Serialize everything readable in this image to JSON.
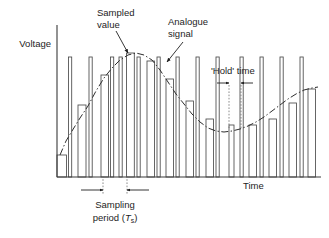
{
  "figure": {
    "title_visible": false,
    "background_color": "#ffffff",
    "line_color": "#333333"
  },
  "axes": {
    "y_label": "Voltage",
    "x_label": "Time",
    "origin": {
      "x": 57,
      "y": 177
    },
    "y_top": 25,
    "x_right": 321
  },
  "annotations": {
    "sampled_value": {
      "line1": "Sampled",
      "line2": "value",
      "text_x": 97,
      "text_y1": 16,
      "text_y2": 28,
      "arrow_from": {
        "x": 116,
        "y": 31
      },
      "arrow_to": {
        "x": 128,
        "y": 53
      }
    },
    "analogue_signal": {
      "line1": "Analogue",
      "line2": "signal",
      "text_x": 168,
      "text_y1": 25,
      "text_y2": 37,
      "arrow_from": {
        "x": 183,
        "y": 42
      },
      "arrow_to": {
        "x": 167,
        "y": 62
      }
    },
    "hold_time": {
      "label": "'Hold' time",
      "text_x": 211,
      "text_y": 74,
      "left_guide_x": 229,
      "right_guide_x": 241,
      "guide_top_y": 85,
      "guide_bottom_y": 128,
      "dim_y": 83
    },
    "sampling_period": {
      "line1": "Sampling",
      "line2": "period (",
      "symbol": "T",
      "subscript": "s",
      "closing": ")",
      "text_x": 77,
      "text_y1": 208,
      "text_y2": 221,
      "left_guide_x": 103,
      "right_guide_x": 127,
      "guide_top_y": 176,
      "guide_bottom_y": 194,
      "dim_y": 190
    }
  },
  "chart_data": {
    "type": "bar",
    "xlabel": "Time",
    "ylabel": "Voltage",
    "grid": false,
    "legend_position": "none",
    "axis_ranges": {
      "x": [
        0,
        26
      ],
      "y": [
        0,
        1
      ]
    },
    "categories": [
      0,
      1,
      2,
      3,
      4,
      5,
      6,
      7,
      8,
      9,
      10,
      11,
      12,
      13,
      14,
      15,
      16,
      17,
      18,
      19,
      20,
      21
    ],
    "bars": [
      {
        "x": 57.0,
        "w": 9.5,
        "h": 22.0
      },
      {
        "x": 68.5,
        "w": 3.2,
        "h": 120.0
      },
      {
        "x": 78.0,
        "w": 8.0,
        "h": 72.0
      },
      {
        "x": 89.0,
        "w": 3.2,
        "h": 120.0
      },
      {
        "x": 101.0,
        "w": 7.5,
        "h": 102.0
      },
      {
        "x": 110.5,
        "w": 3.2,
        "h": 120.0
      },
      {
        "x": 119.0,
        "w": 3.2,
        "h": 120.0
      },
      {
        "x": 126.5,
        "w": 7.8,
        "h": 124.0
      },
      {
        "x": 137.0,
        "w": 3.2,
        "h": 120.0
      },
      {
        "x": 147.0,
        "w": 7.5,
        "h": 116.0
      },
      {
        "x": 157.0,
        "w": 3.2,
        "h": 120.0
      },
      {
        "x": 166.0,
        "w": 7.5,
        "h": 98.0
      },
      {
        "x": 176.0,
        "w": 3.2,
        "h": 120.0
      },
      {
        "x": 186.0,
        "w": 7.5,
        "h": 76.0
      },
      {
        "x": 196.0,
        "w": 3.2,
        "h": 120.0
      },
      {
        "x": 206.0,
        "w": 7.5,
        "h": 58.0
      },
      {
        "x": 216.0,
        "w": 3.2,
        "h": 120.0
      },
      {
        "x": 229.0,
        "w": 5.0,
        "h": 52.0
      },
      {
        "x": 240.0,
        "w": 3.2,
        "h": 120.0
      },
      {
        "x": 249.0,
        "w": 7.5,
        "h": 52.0
      },
      {
        "x": 260.0,
        "w": 3.2,
        "h": 120.0
      },
      {
        "x": 269.0,
        "w": 7.5,
        "h": 58.0
      },
      {
        "x": 280.0,
        "w": 3.2,
        "h": 120.0
      },
      {
        "x": 289.0,
        "w": 7.5,
        "h": 74.0
      },
      {
        "x": 300.0,
        "w": 3.2,
        "h": 120.0
      },
      {
        "x": 308.0,
        "w": 7.5,
        "h": 88.0
      }
    ],
    "signal_path": "M 60,155 L 66,141 L 72,131 L 80,118 L 88,106 L 96,91 L 104,78 L 112,68 L 120,60 L 128,55 L 136,53 L 144,55 L 152,60 L 160,70 L 168,82 L 176,94 L 184,104 L 192,114 L 200,122 L 208,128 L 216,131 L 224,132 L 232,131 L 240,129 L 248,126 L 256,122 L 264,117 L 272,111 L 280,105 L 288,99 L 296,94 L 304,90 L 312,88 L 318,87"
  }
}
